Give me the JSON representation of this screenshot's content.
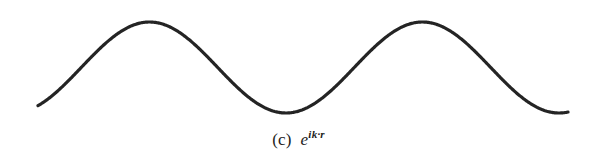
{
  "figure": {
    "background_color": "#ffffff",
    "stroke_color": "#242424",
    "stroke_width": 3.2,
    "caption": {
      "label": "(c)",
      "expression_base": "e",
      "expression_sup_i": "i",
      "expression_sup_k": "k",
      "expression_sup_dot": "·",
      "expression_sup_r": "r",
      "full_text": "(c)  e^{ik·r}"
    }
  },
  "chart_data": {
    "type": "line",
    "title": "",
    "subtitle": "",
    "xlabel": "",
    "ylabel": "",
    "grid": false,
    "legend": null,
    "axis_visible": false,
    "annotations": [
      "(c)  e^{ik·r}"
    ],
    "waveform": {
      "function": "sine",
      "midline_y": 67.5,
      "amplitude_px": 45.5,
      "period_px": 273,
      "phase_start_deg": 303,
      "x_start": 38,
      "x_end": 568,
      "y_start": 74,
      "y_end": 76
    },
    "extrema": [
      {
        "kind": "peak",
        "x": 110,
        "y": 22
      },
      {
        "kind": "trough",
        "x": 246,
        "y": 113
      },
      {
        "kind": "peak",
        "x": 383,
        "y": 22
      },
      {
        "kind": "trough",
        "x": 519,
        "y": 113
      }
    ],
    "xlim": [
      38,
      568
    ],
    "ylim": [
      22,
      113
    ]
  }
}
